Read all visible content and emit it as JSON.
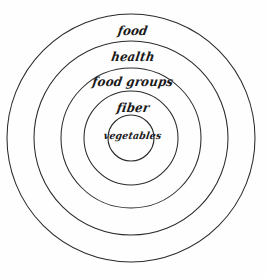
{
  "canvas": {
    "width": 266,
    "height": 278,
    "background_color": "#fefefe",
    "stroke_color": "#2b2b2b",
    "text_color": "#1a1a1a"
  },
  "diagram": {
    "type": "concentric-circles",
    "center": {
      "x": 131,
      "y": 138
    },
    "rings": [
      {
        "id": "food",
        "label": "food",
        "radius": 124,
        "level": 1,
        "label_y": 23
      },
      {
        "id": "health",
        "label": "health",
        "radius": 97,
        "level": 2,
        "label_y": 49
      },
      {
        "id": "food-groups",
        "label": "food groups",
        "radius": 70,
        "level": 3,
        "label_y": 74
      },
      {
        "id": "fiber",
        "label": "fiber",
        "radius": 47,
        "level": 4,
        "label_y": 100
      },
      {
        "id": "vegetables",
        "label": "vegetables",
        "radius": 23,
        "level": 5,
        "label_y": 130
      }
    ]
  }
}
